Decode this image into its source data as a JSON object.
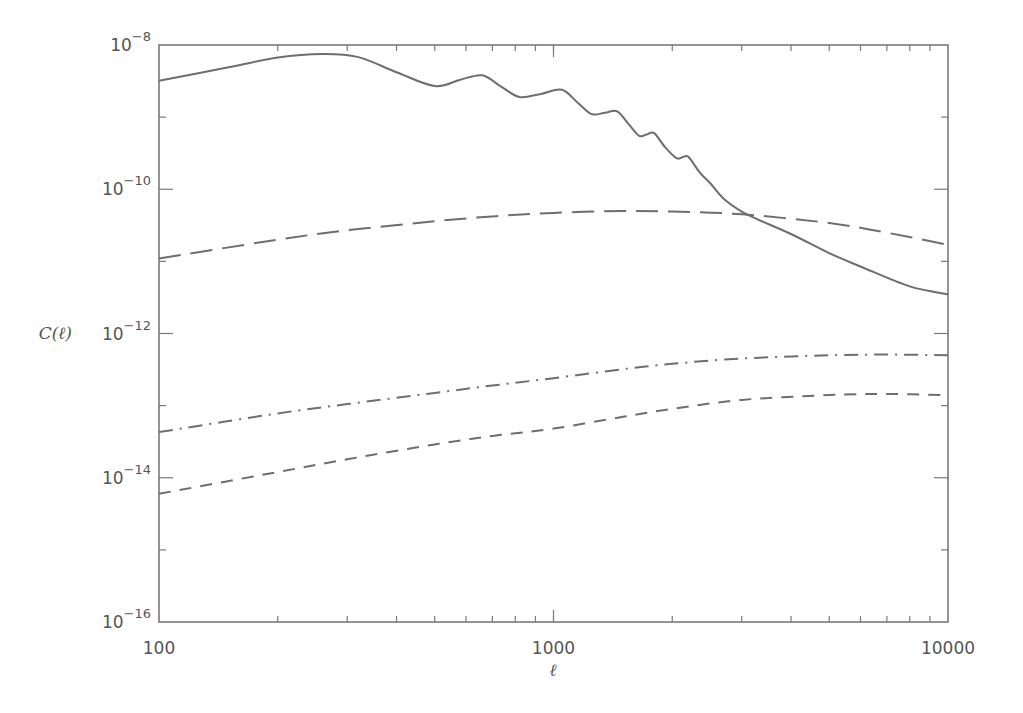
{
  "chart_data": {
    "type": "line",
    "title": "",
    "xlabel": "ℓ",
    "ylabel": "C(ℓ)",
    "xscale": "log",
    "yscale": "log",
    "xlim": [
      100,
      10000
    ],
    "ylim": [
      1e-16,
      1e-08
    ],
    "grid": false,
    "legend": null,
    "x_ticks": [
      {
        "value": 100,
        "label": "100"
      },
      {
        "value": 1000,
        "label": "1000"
      },
      {
        "value": 10000,
        "label": "10000"
      }
    ],
    "y_ticks": [
      {
        "value": 1e-08,
        "base": "10",
        "exp": "−8"
      },
      {
        "value": 1e-10,
        "base": "10",
        "exp": "−10"
      },
      {
        "value": 1e-12,
        "base": "10",
        "exp": "−12"
      },
      {
        "value": 1e-14,
        "base": "10",
        "exp": "−14"
      },
      {
        "value": 1e-16,
        "base": "10",
        "exp": "−16"
      }
    ],
    "series": [
      {
        "name": "solid",
        "style": "solid",
        "x": [
          100,
          150,
          200,
          260,
          320,
          400,
          500,
          580,
          660,
          740,
          820,
          930,
          1050,
          1150,
          1250,
          1350,
          1450,
          1550,
          1650,
          1730,
          1800,
          1920,
          2050,
          2130,
          2200,
          2350,
          2500,
          2700,
          3000,
          3300,
          4000,
          5000,
          6000,
          8000,
          10000
        ],
        "values": [
          3.2e-09,
          4.9e-09,
          6.7e-09,
          7.5e-09,
          6.8e-09,
          4.2e-09,
          2.7e-09,
          3.3e-09,
          3.8e-09,
          2.6e-09,
          1.9e-09,
          2.1e-09,
          2.4e-09,
          1.6e-09,
          1.1e-09,
          1.15e-09,
          1.2e-09,
          8e-10,
          5.5e-10,
          5.8e-10,
          6e-10,
          3.8e-10,
          2.7e-10,
          2.8e-10,
          2.8e-10,
          1.7e-10,
          1.2e-10,
          7.4e-11,
          4.9e-11,
          3.8e-11,
          2.4e-11,
          1.3e-11,
          8.5e-12,
          4.5e-12,
          3.5e-12
        ]
      },
      {
        "name": "long-dashed",
        "style": "long-dash",
        "x": [
          100,
          200,
          300,
          500,
          700,
          1000,
          1500,
          2000,
          3000,
          5000,
          7000,
          10000
        ],
        "values": [
          1.1e-11,
          2e-11,
          2.7e-11,
          3.6e-11,
          4.2e-11,
          4.7e-11,
          5e-11,
          4.9e-11,
          4.5e-11,
          3.4e-11,
          2.5e-11,
          1.7e-11
        ]
      },
      {
        "name": "dash-dot",
        "style": "dash-dot",
        "x": [
          100,
          200,
          300,
          500,
          700,
          1000,
          1500,
          2000,
          3000,
          5000,
          7000,
          10000
        ],
        "values": [
          4.3e-14,
          7.8e-14,
          1.05e-13,
          1.5e-13,
          1.9e-13,
          2.4e-13,
          3.2e-13,
          3.8e-13,
          4.5e-13,
          5e-13,
          5.1e-13,
          5e-13
        ]
      },
      {
        "name": "short-dashed",
        "style": "short-dash",
        "x": [
          100,
          200,
          300,
          500,
          700,
          1000,
          1500,
          2000,
          3000,
          5000,
          7000,
          10000
        ],
        "values": [
          6e-15,
          1.2e-14,
          1.8e-14,
          2.9e-14,
          3.8e-14,
          4.8e-14,
          7e-14,
          9e-14,
          1.2e-13,
          1.4e-13,
          1.45e-13,
          1.4e-13
        ]
      }
    ]
  },
  "axes": {
    "xlabel": "ℓ",
    "ylabel": "C(ℓ)"
  },
  "style": {
    "line_color": "#6e6e6e",
    "axis_color": "#7a7a7a",
    "text_color": "#555555",
    "background": "#ffffff"
  }
}
